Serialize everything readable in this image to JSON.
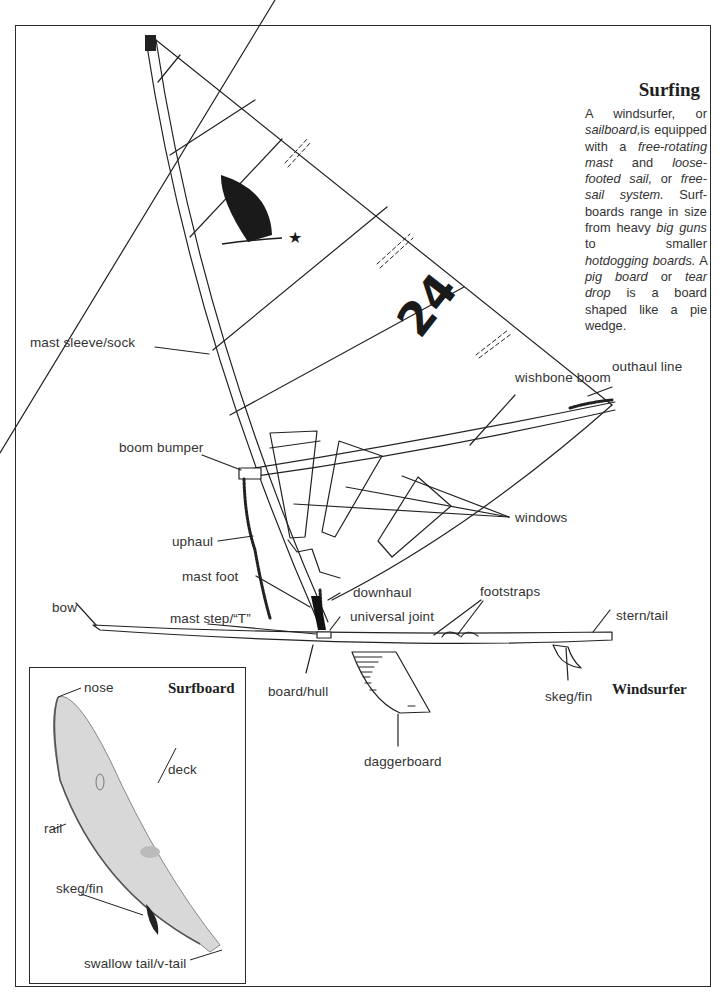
{
  "page": {
    "title": "Surfing",
    "intro": {
      "parts": [
        {
          "t": "A windsurfer, or ",
          "i": false
        },
        {
          "t": "sailboard,",
          "i": true
        },
        {
          "t": "is equipped with a ",
          "i": false
        },
        {
          "t": "free-rotating mast",
          "i": true
        },
        {
          "t": " and ",
          "i": false
        },
        {
          "t": "loose-footed sail,",
          "i": true
        },
        {
          "t": " or ",
          "i": false
        },
        {
          "t": "free-sail system.",
          "i": true
        },
        {
          "t": " Surf-boards range in size from heavy ",
          "i": false
        },
        {
          "t": "big guns",
          "i": true
        },
        {
          "t": " to smaller ",
          "i": false
        },
        {
          "t": "hotdogging boards.",
          "i": true
        },
        {
          "t": " A ",
          "i": false
        },
        {
          "t": "pig board",
          "i": true
        },
        {
          "t": " or ",
          "i": false
        },
        {
          "t": "tear drop",
          "i": true
        },
        {
          "t": " is a board shaped like a pie wedge.",
          "i": false
        }
      ]
    }
  },
  "windsurfer": {
    "heading": "Windsurfer",
    "sail_number": "24",
    "labels": {
      "wishbone_boom": "wishbone boom",
      "mast_sleeve": "mast sleeve/sock",
      "outhaul_line": "outhaul line",
      "boom_bumper": "boom bumper",
      "windows": "windows",
      "uphaul": "uphaul",
      "mast_foot": "mast foot",
      "downhaul": "downhaul",
      "footstraps": "footstraps",
      "bow": "bow",
      "mast_step": "mast step/“T”",
      "universal_joint": "universal joint",
      "stern_tail": "stern/tail",
      "board_hull": "board/hull",
      "skeg_fin": "skeg/fin",
      "daggerboard": "daggerboard"
    }
  },
  "surfboard": {
    "heading": "Surfboard",
    "labels": {
      "nose": "nose",
      "deck": "deck",
      "rail": "rail",
      "skeg_fin": "skeg/fin",
      "swallow_tail": "swallow tail/v-tail"
    }
  }
}
